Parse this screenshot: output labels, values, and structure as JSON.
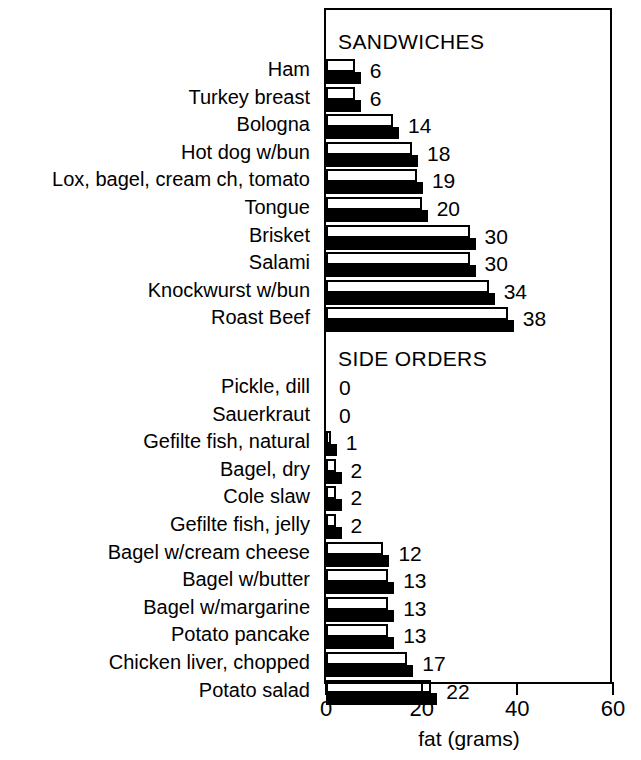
{
  "chart_data": {
    "type": "bar",
    "title": "",
    "xlabel": "fat (grams)",
    "ylabel": "",
    "xlim": [
      0,
      60
    ],
    "xticks": [
      0,
      20,
      40,
      60
    ],
    "xtick_labels": [
      "0",
      "20",
      "40",
      "60"
    ],
    "grid": false,
    "legend": null,
    "orientation": "horizontal",
    "groups": [
      {
        "name": "SANDWICHES",
        "categories": [
          "Ham",
          "Turkey breast",
          "Bologna",
          "Hot dog w/bun",
          "Lox, bagel, cream ch, tomato",
          "Tongue",
          "Brisket",
          "Salami",
          "Knockwurst w/bun",
          "Roast Beef"
        ],
        "values": [
          6,
          6,
          14,
          18,
          19,
          20,
          30,
          30,
          34,
          38
        ],
        "value_labels": [
          "6",
          "6",
          "14",
          "18",
          "19",
          "20",
          "30",
          "30",
          "34",
          "38"
        ]
      },
      {
        "name": "SIDE ORDERS",
        "categories": [
          "Pickle, dill",
          "Sauerkraut",
          "Gefilte fish, natural",
          "Bagel, dry",
          "Cole slaw",
          "Gefilte fish, jelly",
          "Bagel w/cream cheese",
          "Bagel w/butter",
          "Bagel w/margarine",
          "Potato pancake",
          "Chicken liver, chopped",
          "Potato salad"
        ],
        "values": [
          0,
          0,
          1,
          2,
          2,
          2,
          12,
          13,
          13,
          13,
          17,
          22
        ],
        "value_labels": [
          "0",
          "0",
          "1",
          "2",
          "2",
          "2",
          "12",
          "13",
          "13",
          "13",
          "17",
          "22"
        ]
      }
    ]
  },
  "colors": {
    "bar_fill_top": "#ffffff",
    "bar_fill_bottom": "#000000",
    "stroke": "#000000",
    "background": "#ffffff"
  },
  "axis": {
    "title": "fat (grams)",
    "ticks": [
      "0",
      "20",
      "40",
      "60"
    ]
  }
}
